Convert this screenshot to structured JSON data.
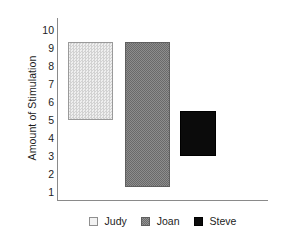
{
  "chart_data": {
    "type": "bar",
    "title": "",
    "xlabel": "",
    "ylabel": "Amount of Stimulation",
    "ylim": [
      0,
      10.6
    ],
    "yticks": [
      "10",
      "9",
      "8",
      "7",
      "6",
      "5",
      "4",
      "3",
      "2",
      "1"
    ],
    "grid": false,
    "legend_position": "bottom",
    "categories": [
      "Judy",
      "Joan",
      "Steve"
    ],
    "note": "Floating bars: each bar spans a range (low to high) rather than starting at zero.",
    "series": [
      {
        "name": "Judy",
        "low": 4.7,
        "high": 9.2,
        "swatch": "light-gray-checkered",
        "color": "#e2e2e2",
        "border_color": "#9a9a9a"
      },
      {
        "name": "Joan",
        "low": 0.8,
        "high": 9.2,
        "swatch": "medium-gray-textured",
        "color": "#7b7b7b",
        "border_color": "#5f5f5f"
      },
      {
        "name": "Steve",
        "low": 2.6,
        "high": 5.2,
        "swatch": "solid-black",
        "color": "#0b0b0b",
        "border_color": "#000000"
      }
    ]
  },
  "legend": {
    "items": [
      {
        "label": "Judy"
      },
      {
        "label": "Joan"
      },
      {
        "label": "Steve"
      }
    ]
  },
  "axes": {
    "y_title": "Amount of Stimulation",
    "axis_color": "#8a8a8a"
  }
}
